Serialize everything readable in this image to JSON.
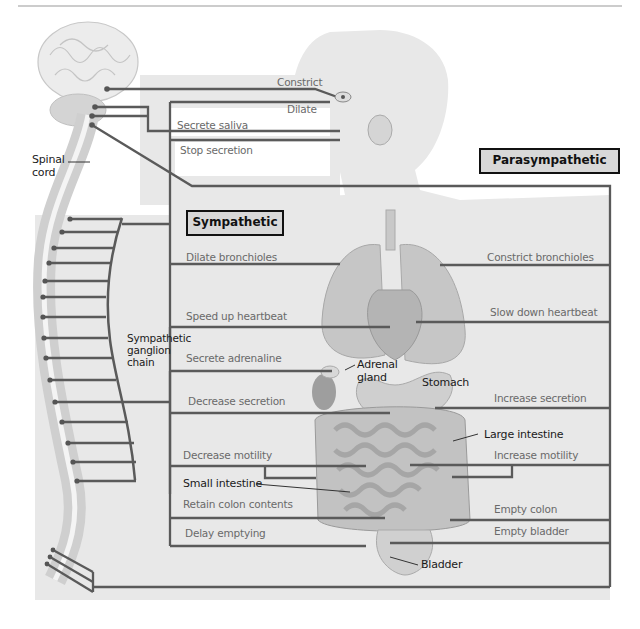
{
  "title_boxes": {
    "parasympathetic": "Parasympathetic",
    "sympathetic": "Sympathetic"
  },
  "anatomy_labels": {
    "spinal_cord": [
      "Spinal",
      "cord"
    ],
    "ganglion_chain": [
      "Sympathetic",
      "ganglion",
      "chain"
    ],
    "adrenal_gland": [
      "Adrenal",
      "gland"
    ],
    "stomach": "Stomach",
    "large_intestine": "Large intestine",
    "small_intestine": "Small intestine",
    "bladder": "Bladder"
  },
  "sympathetic_effects": [
    {
      "organ": "eye",
      "effect": "Dilate"
    },
    {
      "organ": "salivary gland",
      "effect": "Stop secretion"
    },
    {
      "organ": "lungs",
      "effect": "Dilate bronchioles"
    },
    {
      "organ": "heart",
      "effect": "Speed up heartbeat"
    },
    {
      "organ": "adrenal gland",
      "effect": "Secrete adrenaline"
    },
    {
      "organ": "stomach",
      "effect": "Decrease secretion"
    },
    {
      "organ": "intestines",
      "effect": "Decrease motility"
    },
    {
      "organ": "colon",
      "effect": "Retain colon contents"
    },
    {
      "organ": "bladder",
      "effect": "Delay emptying"
    }
  ],
  "parasympathetic_effects": [
    {
      "organ": "eye",
      "effect": "Constrict"
    },
    {
      "organ": "salivary gland",
      "effect": "Secrete saliva"
    },
    {
      "organ": "lungs",
      "effect": "Constrict bronchioles"
    },
    {
      "organ": "heart",
      "effect": "Slow down heartbeat"
    },
    {
      "organ": "stomach",
      "effect": "Increase secretion"
    },
    {
      "organ": "intestines",
      "effect": "Increase motility"
    },
    {
      "organ": "colon",
      "effect": "Empty colon"
    },
    {
      "organ": "bladder",
      "effect": "Empty bladder"
    }
  ],
  "colors": {
    "line": "#5a5a5a",
    "box_fill": "#d8d8d8",
    "body_fill": "#e6e6e6",
    "organ_fill": "#bdbdbd"
  }
}
